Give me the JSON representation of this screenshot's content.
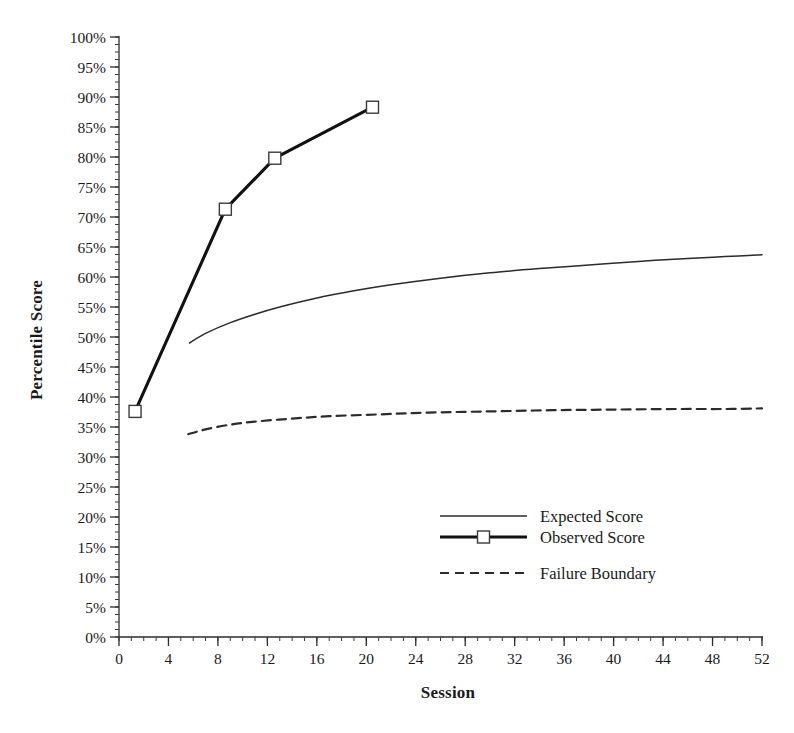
{
  "chart_data": {
    "type": "line",
    "title": "",
    "xlabel": "Session",
    "ylabel": "Percentile Score",
    "xlim": [
      0,
      52
    ],
    "ylim": [
      0,
      100
    ],
    "xticks": [
      0,
      4,
      8,
      12,
      16,
      20,
      24,
      28,
      32,
      36,
      40,
      44,
      48,
      52
    ],
    "xtick_labels": [
      "0",
      "4",
      "8",
      "12",
      "16",
      "20",
      "24",
      "28",
      "32",
      "36",
      "40",
      "44",
      "48",
      "52"
    ],
    "x_minor_step": 1,
    "yticks": [
      0,
      5,
      10,
      15,
      20,
      25,
      30,
      35,
      40,
      45,
      50,
      55,
      60,
      65,
      70,
      75,
      80,
      85,
      90,
      95,
      100
    ],
    "ytick_labels": [
      "0%",
      "5%",
      "10%",
      "15%",
      "20%",
      "25%",
      "30%",
      "35%",
      "40%",
      "45%",
      "50%",
      "55%",
      "60%",
      "65%",
      "70%",
      "75%",
      "80%",
      "85%",
      "90%",
      "95%",
      "100%"
    ],
    "y_minor_step": 1.25,
    "grid": false,
    "legend_position": "center-right",
    "series": [
      {
        "name": "Expected Score",
        "style": "solid-thin",
        "color": "#2b2b2b",
        "marker": "none",
        "x": [
          5.7,
          7,
          9,
          11,
          13,
          16,
          19,
          22,
          26,
          30,
          34,
          38,
          42,
          46,
          49,
          52
        ],
        "y": [
          49.0,
          50.6,
          52.4,
          53.8,
          55.0,
          56.5,
          57.7,
          58.7,
          59.8,
          60.7,
          61.4,
          62.0,
          62.6,
          63.1,
          63.4,
          63.7
        ]
      },
      {
        "name": "Observed Score",
        "style": "solid-thick",
        "color": "#111111",
        "marker": "open-square",
        "x": [
          1.3,
          8.6,
          12.6,
          20.5
        ],
        "y": [
          37.6,
          71.3,
          79.8,
          88.3
        ]
      },
      {
        "name": "Failure Boundary",
        "style": "dashed",
        "color": "#2b2b2b",
        "marker": "none",
        "x": [
          5.6,
          7,
          9,
          11,
          14,
          17,
          21,
          25,
          30,
          35,
          40,
          45,
          49,
          52
        ],
        "y": [
          33.8,
          34.6,
          35.4,
          35.9,
          36.4,
          36.8,
          37.1,
          37.4,
          37.6,
          37.8,
          37.9,
          38.0,
          38.0,
          38.1
        ]
      }
    ]
  },
  "legend": {
    "items": [
      {
        "label": "Expected Score"
      },
      {
        "label": "Observed Score"
      },
      {
        "label": "Failure Boundary"
      }
    ]
  }
}
